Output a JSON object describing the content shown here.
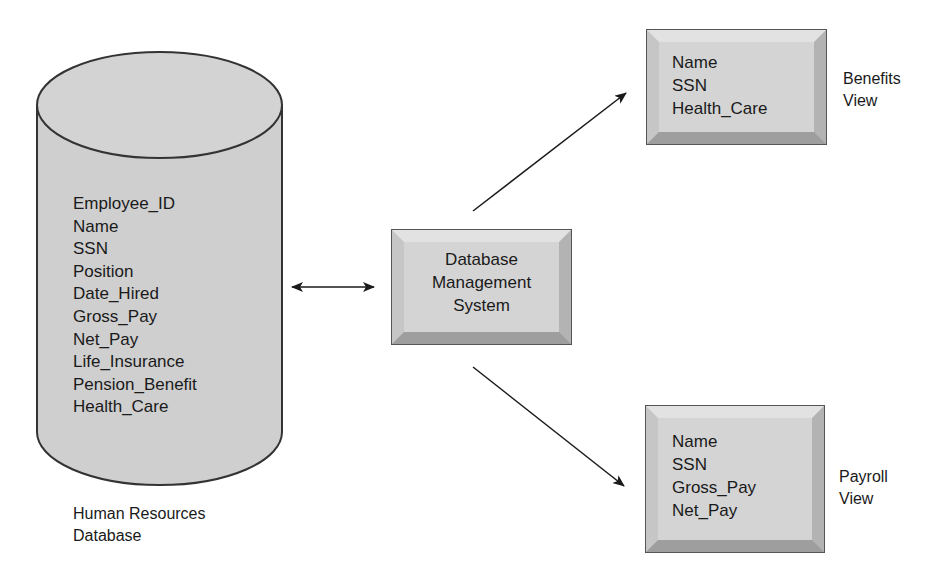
{
  "database": {
    "fields": [
      "Employee_ID",
      "Name",
      "SSN",
      "Position",
      "Date_Hired",
      "Gross_Pay",
      "Net_Pay",
      "Life_Insurance",
      "Pension_Benefit",
      "Health_Care"
    ],
    "label_line1": "Human Resources",
    "label_line2": "Database"
  },
  "dbms": {
    "line1": "Database",
    "line2": "Management",
    "line3": "System"
  },
  "benefits_view": {
    "fields": [
      "Name",
      "SSN",
      "Health_Care"
    ],
    "label_line1": "Benefits",
    "label_line2": "View"
  },
  "payroll_view": {
    "fields": [
      "Name",
      "SSN",
      "Gross_Pay",
      "Net_Pay"
    ],
    "label_line1": "Payroll",
    "label_line2": "View"
  },
  "colors": {
    "cylinder_fill": "#cfcfcf",
    "box_fill": "#d4d4d4",
    "outline": "#333333",
    "text": "#1a1a1a"
  }
}
